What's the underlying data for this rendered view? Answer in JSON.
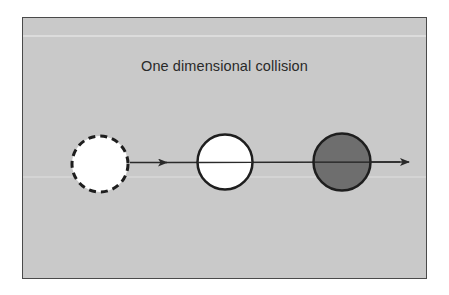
{
  "figure": {
    "title": "One dimensional collision",
    "colors": {
      "background": "#c9c9c9",
      "frame": "#4a4a4a",
      "line": "#2a2a2a",
      "ball_initial_fill": "#ffffff",
      "ball_target_fill": "#ffffff",
      "ball_final_fill": "#6e6e6e"
    },
    "objects": [
      {
        "name": "initial-position-ball",
        "style": "dashed outline",
        "fill": "white"
      },
      {
        "name": "moving-ball",
        "style": "solid outline",
        "fill": "white"
      },
      {
        "name": "struck-ball",
        "style": "solid outline",
        "fill": "dark gray"
      }
    ],
    "arrows": [
      {
        "name": "motion-arrow-1",
        "direction": "right"
      },
      {
        "name": "motion-arrow-2",
        "direction": "right"
      }
    ]
  }
}
